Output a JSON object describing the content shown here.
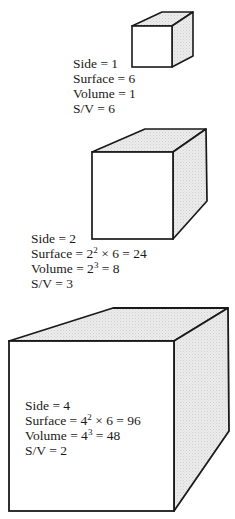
{
  "diagram": {
    "title": "",
    "cubes": [
      {
        "side": "1",
        "lines": {
          "side": "Side = 1",
          "surface": "Surface = 6",
          "volume": "Volume = 1",
          "sv": "S/V = 6"
        }
      },
      {
        "side": "2",
        "lines": {
          "side": "Side = 2",
          "surface_pre": "Surface = 2",
          "surface_exp": "2",
          "surface_post": " × 6 = 24",
          "volume_pre": "Volume = 2",
          "volume_exp": "3",
          "volume_post": " = 8",
          "sv": "S/V = 3"
        }
      },
      {
        "side": "4",
        "lines": {
          "side": "Side = 4",
          "surface_pre": "Surface = 4",
          "surface_exp": "2",
          "surface_post": " × 6 = 96",
          "volume_pre": "Volume = 4",
          "volume_exp": "3",
          "volume_post": " = 48",
          "sv": "S/V = 2"
        }
      }
    ],
    "colors": {
      "stroke": "#1a1a1a",
      "shade": "#e6e6e6",
      "face": "#ffffff"
    }
  }
}
